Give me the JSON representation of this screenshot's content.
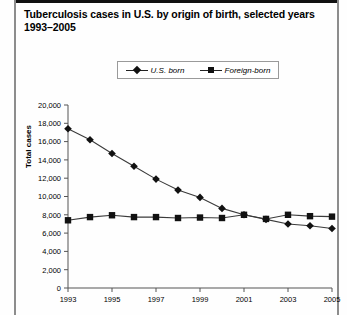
{
  "figure": {
    "title": "Tuberculosis cases in U.S. by origin of birth, selected years 1993–2005"
  },
  "legend": {
    "position": "top-center",
    "entries": [
      {
        "label": "U.S. born",
        "marker": "diamond-marker",
        "color": "#111111"
      },
      {
        "label": "Foreign-born",
        "marker": "square-marker",
        "color": "#111111"
      }
    ]
  },
  "chart_data": {
    "type": "line",
    "title": "Tuberculosis cases in U.S. by origin of birth, selected years 1993–2005",
    "xlabel": "",
    "ylabel": "Total cases",
    "x": [
      1993,
      1994,
      1995,
      1996,
      1997,
      1998,
      1999,
      2000,
      2001,
      2002,
      2003,
      2004,
      2005
    ],
    "xtick_labels": [
      "1993",
      "1995",
      "1997",
      "1999",
      "2001",
      "2003",
      "2005"
    ],
    "xticks": [
      1993,
      1995,
      1997,
      1999,
      2001,
      2003,
      2005
    ],
    "xlim": [
      1993,
      2005
    ],
    "ylim": [
      0,
      20000
    ],
    "yticks": [
      0,
      2000,
      4000,
      6000,
      8000,
      10000,
      12000,
      14000,
      16000,
      18000,
      20000
    ],
    "ytick_labels": [
      "0",
      "2,000",
      "4,000",
      "6,000",
      "8,000",
      "10,000",
      "12,000",
      "14,000",
      "16,000",
      "18,000",
      "20,000"
    ],
    "grid": false,
    "series": [
      {
        "name": "U.S. born",
        "marker": "diamond",
        "color": "#111111",
        "values": [
          17400,
          16200,
          14700,
          13300,
          11900,
          10700,
          9900,
          8700,
          8000,
          7500,
          7000,
          6800,
          6500
        ]
      },
      {
        "name": "Foreign-born",
        "marker": "square",
        "color": "#111111",
        "values": [
          7400,
          7750,
          7950,
          7750,
          7750,
          7650,
          7700,
          7650,
          8000,
          7550,
          8000,
          7850,
          7800
        ]
      }
    ]
  }
}
